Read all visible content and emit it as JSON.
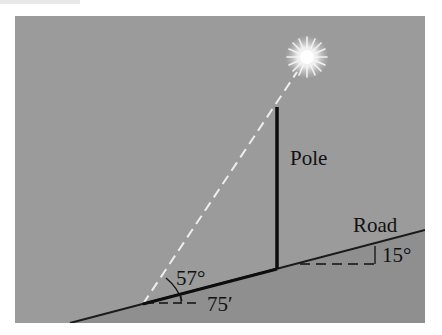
{
  "figure": {
    "header_fragment": "",
    "labels": {
      "pole": "Pole",
      "road": "Road",
      "angle_elevation": "57°",
      "angle_road": "15°",
      "distance": "75′"
    },
    "colors": {
      "background": "#9b9b9b",
      "ground": "#8f8f8f",
      "lines": "#111111",
      "sun_ray": "#f2f2f2",
      "sun": "#ffffff"
    },
    "icons": {
      "sun": "sun-icon"
    }
  }
}
